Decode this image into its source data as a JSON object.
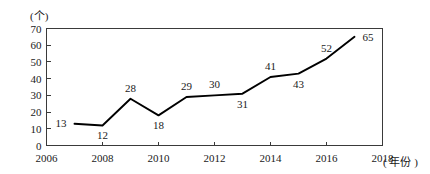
{
  "chart_data": {
    "type": "line",
    "title": "",
    "xlabel": "年份",
    "ylabel": "个",
    "y_unit_label": "(个)",
    "x_unit_label": "( 年份 )",
    "xlim": [
      2006,
      2018
    ],
    "ylim": [
      0,
      70
    ],
    "grid": false,
    "legend": "none",
    "y_ticks": [
      70,
      60,
      50,
      40,
      30,
      20,
      10,
      0
    ],
    "y_tick_labels": [
      "70",
      "60",
      "50",
      "40",
      "30",
      "20",
      "10",
      "0"
    ],
    "x_ticks": [
      2006,
      2008,
      2010,
      2012,
      2014,
      2016,
      2018
    ],
    "x_tick_labels": [
      "2006",
      "2008",
      "2010",
      "2012",
      "2014",
      "2016",
      "2018"
    ],
    "x": [
      2007,
      2008,
      2009,
      2010,
      2011,
      2012,
      2013,
      2014,
      2015,
      2016,
      2017
    ],
    "values": [
      13,
      12,
      28,
      18,
      29,
      30,
      31,
      41,
      43,
      52,
      65
    ],
    "point_labels": [
      {
        "x": 2007,
        "value": 13,
        "text": "13",
        "position": "left"
      },
      {
        "x": 2008,
        "value": 12,
        "text": "12",
        "position": "below"
      },
      {
        "x": 2009,
        "value": 28,
        "text": "28",
        "position": "above"
      },
      {
        "x": 2010,
        "value": 18,
        "text": "18",
        "position": "below"
      },
      {
        "x": 2011,
        "value": 29,
        "text": "29",
        "position": "above"
      },
      {
        "x": 2012,
        "value": 30,
        "text": "30",
        "position": "above"
      },
      {
        "x": 2013,
        "value": 31,
        "text": "31",
        "position": "below"
      },
      {
        "x": 2014,
        "value": 41,
        "text": "41",
        "position": "above"
      },
      {
        "x": 2015,
        "value": 43,
        "text": "43",
        "position": "below"
      },
      {
        "x": 2016,
        "value": 52,
        "text": "52",
        "position": "above"
      },
      {
        "x": 2017,
        "value": 65,
        "text": "65",
        "position": "right"
      }
    ],
    "colors": {
      "line": "#000000",
      "frame": "#3a3a3a",
      "text": "#1a1a1a",
      "background": "#ffffff"
    }
  }
}
